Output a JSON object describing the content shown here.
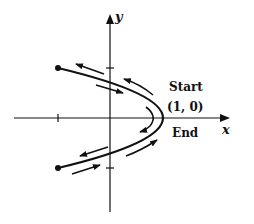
{
  "figure": {
    "type": "parametric-curve-diagram",
    "axes": {
      "x_label": "x",
      "y_label": "y",
      "ticks": {
        "x": [
          -1
        ],
        "y": [
          1,
          -1
        ]
      }
    },
    "curve": {
      "shape": "parabola x = 1 - y^2",
      "vertex": [
        1,
        0
      ],
      "endpoints": [
        [
          -1,
          1
        ],
        [
          -1,
          -1
        ]
      ],
      "endpoint_markers": "filled-dot"
    },
    "labels": {
      "start": "Start",
      "point": "(1, 0)",
      "end": "End"
    },
    "arrows": [
      {
        "location": "upper-outer",
        "direction": "toward upper-left endpoint"
      },
      {
        "location": "upper-outer-near-vertex",
        "direction": "away from vertex (up-left)"
      },
      {
        "location": "upper-inner",
        "direction": "toward vertex (down-right)"
      },
      {
        "location": "inner-vertex",
        "direction": "curving downward around vertex"
      },
      {
        "location": "lower-inner",
        "direction": "toward lower-left endpoint"
      },
      {
        "location": "lower-outer",
        "direction": "toward vertex (up-right)"
      },
      {
        "location": "lower-outer-far",
        "direction": "toward vertex (right)"
      }
    ],
    "colors": {
      "ink": "#111111",
      "background": "#ffffff"
    }
  }
}
